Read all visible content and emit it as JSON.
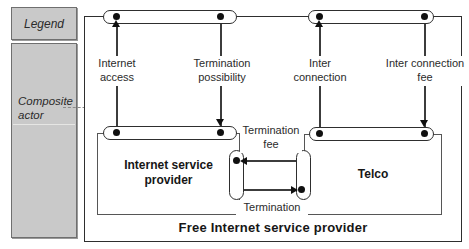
{
  "legend": {
    "title": "Legend",
    "composite_actor_label": "Composite actor"
  },
  "boxes": {
    "free_isp": "Free Internet service provider",
    "isp": "Internet service provider",
    "telco": "Telco"
  },
  "connectors": {
    "internet_access": "Internet access",
    "termination_possibility": "Termination possibility",
    "inter_connection": "Inter connection",
    "inter_connection_fee": "Inter connection fee",
    "termination_fee": "Termination fee",
    "termination": "Termination"
  },
  "colors": {
    "line": "#3c3c3c",
    "legend_fill": "#c9c9c9",
    "background": "#ffffff"
  }
}
